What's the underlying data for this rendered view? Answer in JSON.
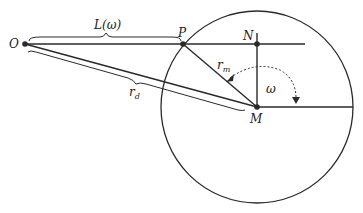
{
  "diagram": {
    "type": "geometry",
    "colors": {
      "stroke": "#2a2a2a",
      "background": "#ffffff"
    },
    "circle": {
      "cx": 257,
      "cy": 107,
      "r": 96
    },
    "points": {
      "O": {
        "label": "O",
        "x": 25,
        "y": 44
      },
      "P": {
        "label": "P",
        "x": 183,
        "y": 44
      },
      "N": {
        "label": "N",
        "x": 257,
        "y": 44
      },
      "M": {
        "label": "M",
        "x": 257,
        "y": 107
      }
    },
    "labels": {
      "L": "L(ω)",
      "r_d_base": "r",
      "r_d_sub": "d",
      "r_m_base": "r",
      "r_m_sub": "m",
      "omega": "ω"
    }
  }
}
